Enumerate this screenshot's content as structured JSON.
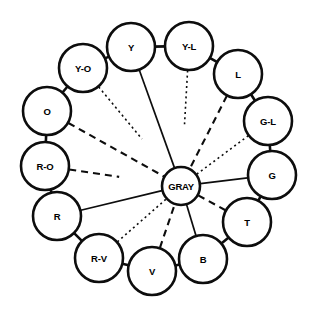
{
  "diagram": {
    "type": "radial-node-diagram",
    "background_color": "#ffffff",
    "stroke_color": "#0d0d0d",
    "center": {
      "label": "GRAY",
      "cx": 181,
      "cy": 186,
      "r": 19
    },
    "geometry": {
      "ring_center_x": 158,
      "ring_center_y": 155,
      "ring_radius": 108,
      "node_radius": 24,
      "node_count": 13
    },
    "nodes": [
      {
        "id": "y",
        "label": "Y",
        "cx": 131,
        "cy": 47,
        "r": 24,
        "angle_deg": -105,
        "spoke_style": "solid",
        "spoke_reach": 1.0
      },
      {
        "id": "yl",
        "label": "Y-L",
        "cx": 189,
        "cy": 46,
        "r": 24,
        "angle_deg": -75,
        "spoke_style": "dotted",
        "spoke_reach": 0.56
      },
      {
        "id": "l",
        "label": "L",
        "cx": 238,
        "cy": 74,
        "r": 24,
        "angle_deg": -45,
        "spoke_style": "dashed",
        "spoke_reach": 1.0
      },
      {
        "id": "gl",
        "label": "G-L",
        "cx": 268,
        "cy": 121,
        "r": 24,
        "angle_deg": -20,
        "spoke_style": "dotted",
        "spoke_reach": 1.0
      },
      {
        "id": "g",
        "label": "G",
        "cx": 272,
        "cy": 175,
        "r": 24,
        "angle_deg": 5,
        "spoke_style": "solid",
        "spoke_reach": 1.0
      },
      {
        "id": "t",
        "label": "T",
        "cx": 247,
        "cy": 222,
        "r": 24,
        "angle_deg": 33,
        "spoke_style": "dashed",
        "spoke_reach": 1.0
      },
      {
        "id": "b",
        "label": "B",
        "cx": 203,
        "cy": 259,
        "r": 24,
        "angle_deg": 60,
        "spoke_style": "solid",
        "spoke_reach": 1.0
      },
      {
        "id": "v",
        "label": "V",
        "cx": 152,
        "cy": 271,
        "r": 24,
        "angle_deg": 88,
        "spoke_style": "dashed",
        "spoke_reach": 1.0
      },
      {
        "id": "rv",
        "label": "R-V",
        "cx": 99,
        "cy": 258,
        "r": 24,
        "angle_deg": 114,
        "spoke_style": "dotted",
        "spoke_reach": 1.0
      },
      {
        "id": "r",
        "label": "R",
        "cx": 57,
        "cy": 216,
        "r": 24,
        "angle_deg": 145,
        "spoke_style": "solid",
        "spoke_reach": 1.0
      },
      {
        "id": "ro",
        "label": "R-O",
        "cx": 45,
        "cy": 166,
        "r": 24,
        "angle_deg": 172,
        "spoke_style": "dashed",
        "spoke_reach": 0.54
      },
      {
        "id": "o",
        "label": "O",
        "cx": 47,
        "cy": 111,
        "r": 24,
        "angle_deg": -160,
        "spoke_style": "dashed",
        "spoke_reach": 1.0
      },
      {
        "id": "yo",
        "label": "Y-O",
        "cx": 83,
        "cy": 68,
        "r": 24,
        "angle_deg": -133,
        "spoke_style": "dotted",
        "spoke_reach": 0.62
      }
    ],
    "ring_links": [
      [
        "yo",
        "y"
      ],
      [
        "y",
        "yl"
      ],
      [
        "yl",
        "l"
      ],
      [
        "l",
        "gl"
      ],
      [
        "gl",
        "g"
      ],
      [
        "g",
        "t"
      ],
      [
        "t",
        "b"
      ],
      [
        "b",
        "v"
      ],
      [
        "v",
        "rv"
      ],
      [
        "rv",
        "r"
      ],
      [
        "r",
        "ro"
      ],
      [
        "ro",
        "o"
      ],
      [
        "o",
        "yo"
      ]
    ],
    "legend": {
      "solid": "primary relation",
      "dashed": "secondary relation",
      "dotted": "tertiary relation"
    }
  }
}
